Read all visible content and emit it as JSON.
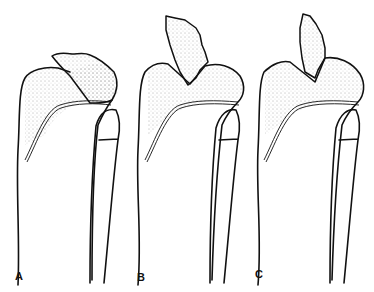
{
  "figure": {
    "panels": [
      {
        "label": "A",
        "description": "Tibial tubercle fracture, small distal fragment"
      },
      {
        "label": "B",
        "description": "Tibial tubercle fracture, larger displaced fragment"
      },
      {
        "label": "C",
        "description": "Tibial tubercle fracture extending into proximal tibia"
      }
    ],
    "colors": {
      "line": "#111111",
      "background": "#ffffff",
      "stipple": "#555555"
    }
  }
}
